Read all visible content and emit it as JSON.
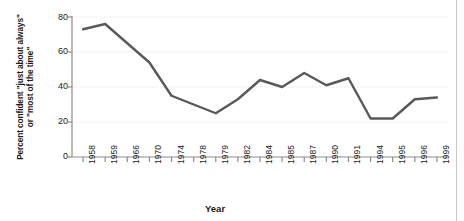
{
  "chart_data": {
    "type": "line",
    "title": "",
    "xlabel": "Year",
    "ylabel_line1": "Percent confident \"just about always\"",
    "ylabel_line2": "or \"most of the time\"",
    "categories": [
      "1958",
      "1959",
      "1966",
      "1970",
      "1974",
      "1978",
      "1979",
      "1982",
      "1984",
      "1985",
      "1987",
      "1990",
      "1991",
      "1994",
      "1995",
      "1996",
      "1999"
    ],
    "values": [
      73,
      76,
      65,
      54,
      35,
      30,
      25,
      33,
      44,
      40,
      48,
      41,
      45,
      22,
      22,
      33,
      34
    ],
    "ylim": [
      0,
      80
    ],
    "ytick_labels": [
      "0",
      "20",
      "40",
      "60",
      "80"
    ],
    "ytick_values": [
      0,
      20,
      40,
      60,
      80
    ],
    "grid": true,
    "legend": "none",
    "line_color": "#58595b",
    "grid_color": "#e3e3e3",
    "axis_color": "#8c8c8c",
    "text_color": "#1a1a1a",
    "background_color": "#ffffff"
  },
  "axes": {
    "y_axis_name": "percent-confident-axis",
    "x_axis_name": "year-axis"
  }
}
